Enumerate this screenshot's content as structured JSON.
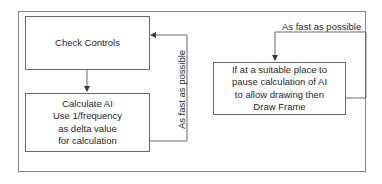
{
  "diagram": {
    "left_flow": {
      "box_check_controls": {
        "label": "Check Controls"
      },
      "box_calculate_ai": {
        "lines": [
          "Calculate AI",
          "Use 1/frequency",
          "as delta value",
          "for calculation"
        ]
      },
      "loop_label": "As fast as possible"
    },
    "right_flow": {
      "box_draw": {
        "lines": [
          "If at a suitable place to",
          "pause calculation of AI",
          "to allow drawing then",
          "Draw Frame"
        ]
      },
      "loop_label": "As fast as possible"
    },
    "colors": {
      "line": "#6a6a6a",
      "frame": "#8a8a8a",
      "text": "#2a2a2a",
      "background": "#ffffff"
    }
  }
}
